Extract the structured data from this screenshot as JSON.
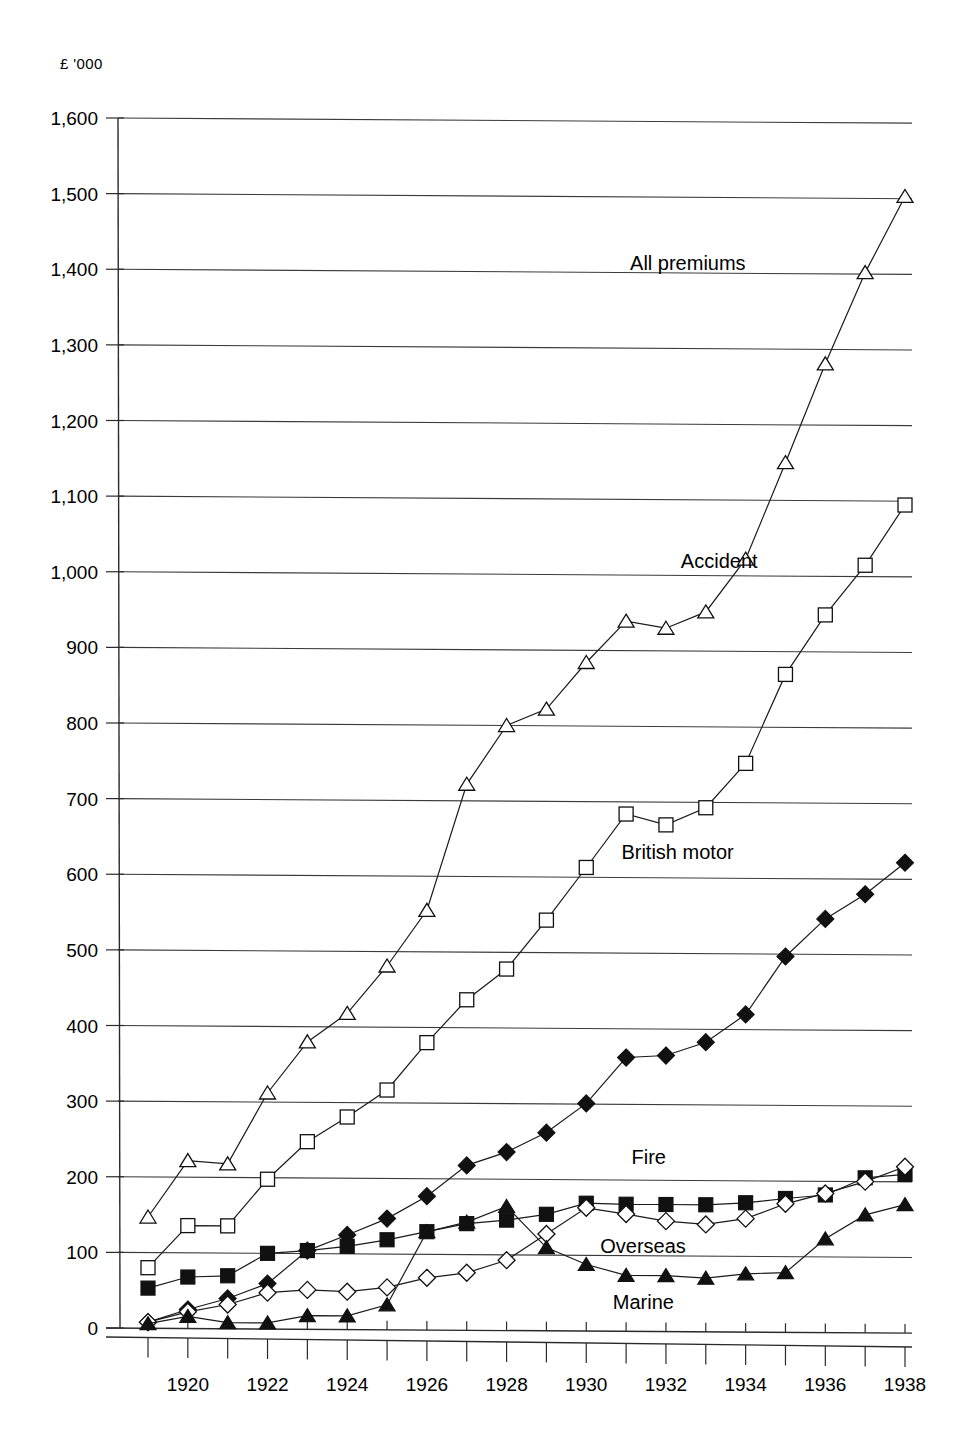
{
  "chart_data": {
    "type": "line",
    "title": "",
    "subtitle": "",
    "unit_label": "£ '000",
    "xlabel": "",
    "ylabel": "",
    "ylim": [
      0,
      1600
    ],
    "ytick_step": 100,
    "grid": true,
    "legend_position": "inline-annotations",
    "x": [
      1919,
      1920,
      1921,
      1922,
      1923,
      1924,
      1925,
      1926,
      1927,
      1928,
      1929,
      1930,
      1931,
      1932,
      1933,
      1934,
      1935,
      1936,
      1937,
      1938
    ],
    "xtick_labels": [
      "1920",
      "1922",
      "1924",
      "1926",
      "1928",
      "1930",
      "1932",
      "1934",
      "1936",
      "1938"
    ],
    "xtick_values": [
      1920,
      1922,
      1924,
      1926,
      1928,
      1930,
      1932,
      1934,
      1936,
      1938
    ],
    "ytick_labels": [
      "0",
      "100",
      "200",
      "300",
      "400",
      "500",
      "600",
      "700",
      "800",
      "900",
      "1,000",
      "1,100",
      "1,200",
      "1,300",
      "1,400",
      "1,500",
      "1,600"
    ],
    "ytick_values": [
      0,
      100,
      200,
      300,
      400,
      500,
      600,
      700,
      800,
      900,
      1000,
      1100,
      1200,
      1300,
      1400,
      1500,
      1600
    ],
    "series": [
      {
        "name": "All premiums",
        "marker": "triangle-open",
        "label_x": 1934.0,
        "label_y": 1405,
        "values": [
          147,
          222,
          218,
          312,
          380,
          418,
          481,
          555,
          722,
          800,
          822,
          884,
          939,
          930,
          952,
          1022,
          1150,
          1281,
          1402,
          1503
        ]
      },
      {
        "name": "Accident",
        "marker": "square-open",
        "label_x": 1934.3,
        "label_y": 1010,
        "values": [
          80,
          136,
          136,
          198,
          248,
          281,
          317,
          380,
          437,
          478,
          543,
          613,
          684,
          670,
          693,
          752,
          870,
          949,
          1015,
          1095
        ]
      },
      {
        "name": "British motor",
        "marker": "diamond-filled",
        "label_x": 1933.7,
        "label_y": 625,
        "values": [
          8,
          25,
          40,
          60,
          104,
          125,
          147,
          177,
          218,
          236,
          262,
          301,
          362,
          365,
          383,
          420,
          497,
          547,
          580,
          622
        ]
      },
      {
        "name": "Fire",
        "marker": "square-filled",
        "label_x": 1932.0,
        "label_y": 222,
        "values": [
          53,
          68,
          70,
          100,
          104,
          110,
          119,
          130,
          141,
          146,
          154,
          169,
          168,
          168,
          168,
          171,
          177,
          182,
          205,
          210
        ]
      },
      {
        "name": "Overseas",
        "marker": "diamond-open",
        "label_x": 1932.5,
        "label_y": 104,
        "values": [
          8,
          22,
          32,
          48,
          52,
          50,
          56,
          69,
          76,
          93,
          128,
          163,
          155,
          146,
          142,
          150,
          170,
          184,
          200,
          220
        ]
      },
      {
        "name": "Marine",
        "marker": "triangle-filled",
        "label_x": 1932.2,
        "label_y": 30,
        "values": [
          6,
          16,
          8,
          8,
          18,
          18,
          33,
          130,
          143,
          164,
          110,
          88,
          74,
          74,
          71,
          77,
          79,
          124,
          156,
          170
        ]
      }
    ]
  }
}
